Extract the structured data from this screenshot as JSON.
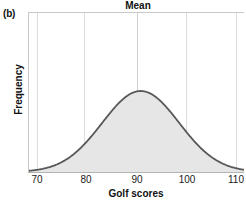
{
  "panel": {
    "label": "(b)"
  },
  "chart_data": {
    "type": "area",
    "title": "Mean",
    "xlabel": "Golf scores",
    "ylabel": "Frequency",
    "xlim": [
      66,
      112
    ],
    "ylim": [
      0,
      1
    ],
    "xticks": [
      70,
      80,
      90,
      100,
      110
    ],
    "xtick_labels": [
      "70",
      "80",
      "90",
      "100",
      "110"
    ],
    "ytick_labels": [],
    "grid": "vertical",
    "legend": "none",
    "annotations": [
      {
        "text": "Mean",
        "x": 90,
        "position": "top-center"
      }
    ],
    "distribution": {
      "shape": "normal",
      "mean": 90,
      "std": 8.2,
      "peak_value": 1.0
    },
    "x": [
      66,
      68,
      70,
      72,
      74,
      76,
      78,
      80,
      82,
      84,
      86,
      88,
      90,
      92,
      94,
      96,
      98,
      100,
      102,
      104,
      106,
      108,
      110,
      112
    ],
    "values": [
      0.011,
      0.022,
      0.043,
      0.078,
      0.133,
      0.213,
      0.319,
      0.446,
      0.58,
      0.706,
      0.809,
      0.887,
      1.0,
      0.887,
      0.809,
      0.706,
      0.58,
      0.446,
      0.319,
      0.213,
      0.133,
      0.078,
      0.043,
      0.022
    ],
    "style": {
      "fill_color": "#e6e6e6",
      "line_color": "#585858",
      "grid_color": "#dcdcdc",
      "axis_color": "#c8c8c8",
      "text_color": "#111111"
    }
  }
}
